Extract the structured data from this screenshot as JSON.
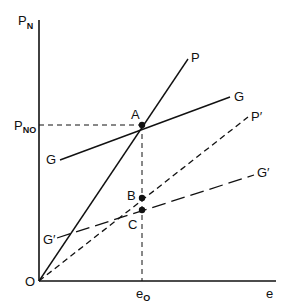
{
  "diagram": {
    "axes": {
      "y_label": "P",
      "y_label_sub": "N",
      "x_label": "e",
      "origin_label": "O",
      "x_mark_label": "e",
      "x_mark_sub": "O",
      "y_mark_label": "P",
      "y_mark_sub": "NO"
    },
    "lines": {
      "P": {
        "label": "P",
        "style": "solid"
      },
      "G": {
        "label_end": "G",
        "label_start": "G",
        "style": "solid"
      },
      "P_prime": {
        "label": "P′",
        "style": "short-dash"
      },
      "G_prime": {
        "label_end": "G′",
        "label_start": "G′",
        "style": "long-dash"
      }
    },
    "points": {
      "A": "A",
      "B": "B",
      "C": "C"
    },
    "colors": {
      "ink": "#111111",
      "background": "#ffffff"
    }
  }
}
